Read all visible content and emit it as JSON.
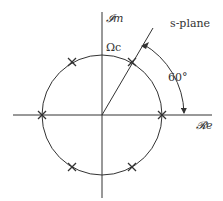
{
  "diagram": {
    "title": "s-plane",
    "axes": {
      "imaginary_label": "𝓘m",
      "real_label": "𝓡e"
    },
    "circle_label": "Ωc",
    "angle_label": "60°",
    "poles": [
      {
        "angle_deg": 0
      },
      {
        "angle_deg": 60
      },
      {
        "angle_deg": 120
      },
      {
        "angle_deg": 180
      },
      {
        "angle_deg": 240
      },
      {
        "angle_deg": 300
      }
    ],
    "colors": {
      "stroke": "#333333"
    }
  }
}
